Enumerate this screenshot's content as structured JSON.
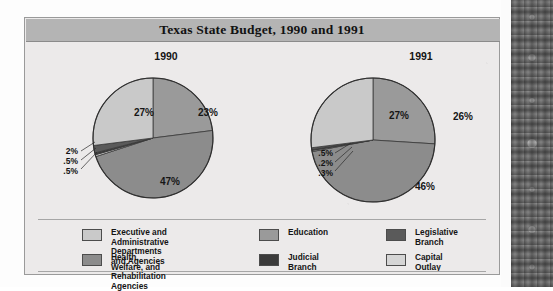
{
  "figure": {
    "title": "Texas State Budget, 1990 and 1991"
  },
  "colors": {
    "executive": "#c9c9c9",
    "education": "#9a9a9a",
    "legislative": "#5a5a5a",
    "health": "#8c8c8c",
    "judicial": "#3b3b3b",
    "capital_outlay": "#d5d5d5",
    "panel_background": "#eceaea",
    "title_bar": "#b4b4b4",
    "outline": "#3a3a3a"
  },
  "charts": [
    {
      "name": "1990",
      "label": "1990",
      "labels_in_pie": [
        "23%",
        "47%",
        "27%"
      ],
      "small_labels": [
        "2%",
        ".5%",
        ".5%"
      ]
    },
    {
      "name": "1991",
      "label": "1991",
      "labels_in_pie": [
        "26%",
        "46%",
        "27%"
      ],
      "small_labels": [
        ".5%",
        ".2%",
        ".3%"
      ]
    }
  ],
  "legend": {
    "items": [
      {
        "label": "Executive and Administrative\nDepartments and Agencies",
        "color": "#c9c9c9"
      },
      {
        "label": "Health, Welfare, and\nRehabilitation Agencies",
        "color": "#8c8c8c"
      },
      {
        "label": "Education",
        "color": "#9a9a9a"
      },
      {
        "label": "Judicial Branch",
        "color": "#3b3b3b"
      },
      {
        "label": "Legislative Branch",
        "color": "#5a5a5a"
      },
      {
        "label": "Capital Outlay",
        "color": "#d5d5d5"
      }
    ]
  },
  "chart_data": [
    {
      "type": "pie",
      "title": "1990",
      "categories": [
        "Education",
        "Health, Welfare, and Rehabilitation Agencies",
        "Capital Outlay",
        "Judicial Branch",
        "Legislative Branch",
        "Executive and Administrative Departments and Agencies"
      ],
      "values": [
        23,
        47,
        0.5,
        0.5,
        2,
        27
      ],
      "display_labels": [
        "23%",
        "47%",
        ".5%",
        ".5%",
        "2%",
        "27%"
      ],
      "colors": [
        "#9a9a9a",
        "#8c8c8c",
        "#d5d5d5",
        "#3b3b3b",
        "#5a5a5a",
        "#c9c9c9"
      ],
      "start_angle_deg": 0,
      "direction": "clockwise",
      "legend": "bottom",
      "units": "percent"
    },
    {
      "type": "pie",
      "title": "1991",
      "categories": [
        "Education",
        "Health, Welfare, and Rehabilitation Agencies",
        "Capital Outlay",
        "Judicial Branch",
        "Legislative Branch",
        "Executive and Administrative Departments and Agencies"
      ],
      "values": [
        26,
        46,
        0.3,
        0.2,
        0.5,
        27
      ],
      "display_labels": [
        "26%",
        "46%",
        ".3%",
        ".2%",
        ".5%",
        "27%"
      ],
      "colors": [
        "#9a9a9a",
        "#8c8c8c",
        "#d5d5d5",
        "#3b3b3b",
        "#5a5a5a",
        "#c9c9c9"
      ],
      "start_angle_deg": 0,
      "direction": "clockwise",
      "legend": "bottom",
      "units": "percent"
    }
  ]
}
